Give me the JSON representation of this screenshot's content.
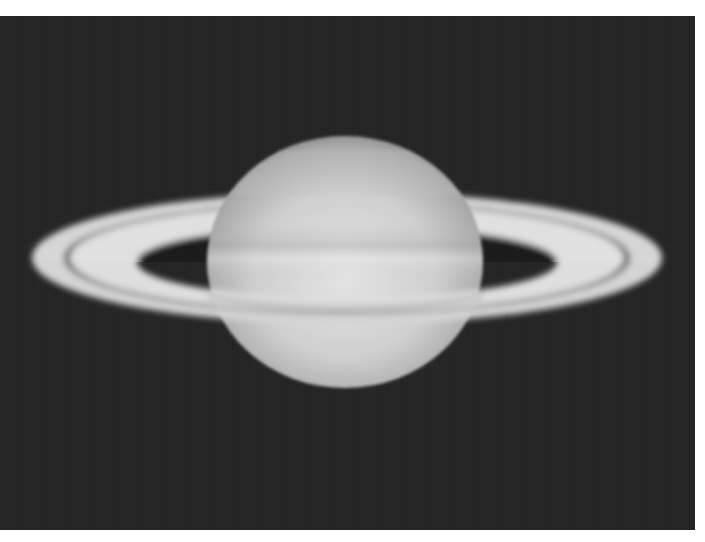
{
  "image": {
    "subject": "Saturn",
    "description": "Grayscale telescope photograph of the planet Saturn with its ring system tilted, showing the Cassini division",
    "colors": {
      "frame": "#ffffff",
      "sky": "#242424",
      "planet_light": "#d8d8d8",
      "planet_mid": "#bdbdbd",
      "ring": "#dcdcdc",
      "cassini_division": "#5a5a5a"
    },
    "features": [
      "planet-globe",
      "ring-a",
      "ring-b",
      "cassini-division",
      "ring-shadow-gap"
    ]
  }
}
